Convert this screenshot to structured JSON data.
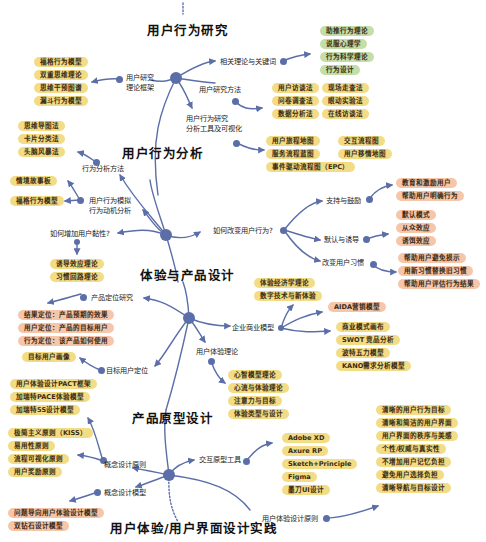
{
  "colors": {
    "link": "#5b6ea8",
    "node": "#5b6ea8",
    "pill_yellow": "#f2dc86",
    "pill_green": "#c4dea7",
    "pill_orange": "#f6c6ab"
  },
  "sections": {
    "user_behavior_research": "用户行为研究",
    "user_behavior_analysis": "用户行为分析",
    "experience_product_design": "体验与产品设计",
    "prototype_design": "产品原型设计",
    "ux_ui_practice": "用户体验/用户界面设计实践"
  },
  "research": {
    "theory_framework": {
      "label": "用户研究\n理论框架",
      "items": [
        "福格行为模型",
        "双重思维理论",
        "思维干预图谱",
        "漏斗行为模型"
      ]
    },
    "related_theory": {
      "label": "相关理论与关键词",
      "items": [
        "助推行为理论",
        "说服心理学",
        "行为科学理论",
        "行为设计"
      ]
    },
    "methods": {
      "label": "用户研究方法",
      "items": [
        "用户访谈法",
        "现场走查法",
        "问卷调查法",
        "眼动实验法",
        "数据分析法",
        "在线访谈法"
      ]
    },
    "tools": {
      "label": "用户行为研究\n分析工具及可视化",
      "items": [
        "用户旅程地图",
        "交互流程图",
        "服务流程蓝图",
        "用户移情地图",
        "事件驱动流程图（EPC）"
      ]
    }
  },
  "analysis": {
    "methods": {
      "label": "行为分析方法",
      "items": [
        "思维导图法",
        "卡片分类法",
        "头脑风暴法"
      ]
    },
    "simulation": {
      "label": "用户行为模拟\n行为动机分析",
      "items": [
        "情境故事板",
        "福格行为模型"
      ]
    },
    "stickiness": {
      "label": "如何增加用户黏性?",
      "items": [
        "诱导效应理论",
        "习惯回路理论"
      ]
    },
    "change": {
      "label": "如何改变用户行为?",
      "support": {
        "label": "支持与鼓励",
        "items": [
          "教育和激励用户",
          "帮助用户明确行为"
        ]
      },
      "default": {
        "label": "默认与诱导",
        "items": [
          "默认模式",
          "从众效应",
          "诱饵效应"
        ]
      },
      "habit": {
        "label": "改变用户习惯",
        "items": [
          "帮助用户避免损示",
          "用新习惯替换旧习惯",
          "帮助用户评估行为结果"
        ]
      }
    }
  },
  "design": {
    "positioning": {
      "label": "产品定位研究",
      "items": [
        "结果定位：产品预期的效果",
        "用户定位：产品的目标用户",
        "行为定位：该产品如何使用"
      ]
    },
    "target_user": {
      "label": "目标用户定位",
      "items": [
        "目标用户画像"
      ]
    },
    "business": {
      "label": "企业商业模型",
      "items_top": [
        "体验经济学理论",
        "数字技术与新体验"
      ],
      "items_mid": [
        "AIDA营销模型"
      ],
      "items_bottom": [
        "商业模式画布",
        "SWOT 竞品分析",
        "波特五力模型",
        "KANO需求分析模型"
      ]
    },
    "ux_theory": {
      "label": "用户体验理论",
      "items": [
        "心智模型理论",
        "心流与体验理论",
        "注意力与目标",
        "体验类型与设计"
      ]
    }
  },
  "prototype": {
    "models_top": [
      "用户体验设计PACT框架",
      "加瑞特PACE体验模型",
      "加瑞特5S设计模型"
    ],
    "principles": {
      "label": "概念设计原则",
      "items": [
        "极简主义原则（KISS）",
        "易用性原则",
        "流程可视化原则",
        "用户奖励原则"
      ]
    },
    "concept_model": {
      "label": "概念设计模型",
      "items": [
        "问题导向用户体验设计模型",
        "双钻石设计模型"
      ]
    },
    "tools": {
      "label": "交互原型工具",
      "items": [
        "Adobe XD",
        "Axure RP",
        "Sketch+Principle",
        "Figma",
        "墨刀UI设计"
      ]
    },
    "ux_principles": {
      "label": "用户体验设计原则",
      "items": [
        "清晰的用户行为目标",
        "清晰和简洁的用户界面",
        "用户界面的秩序与美感",
        "个性/权威与真实性",
        "不增加用户记忆负担",
        "避免用户选择负担",
        "清晰导航与目标设计"
      ]
    }
  }
}
